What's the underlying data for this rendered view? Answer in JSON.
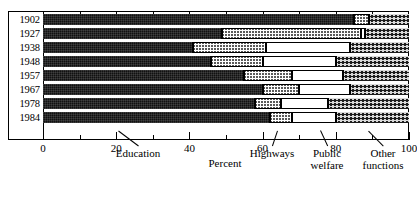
{
  "chart_data": {
    "type": "bar",
    "orientation": "horizontal",
    "stacked": true,
    "stacked_percent": true,
    "title": "",
    "subtitle": "",
    "xlabel": "Percent",
    "ylabel": "",
    "xlim": [
      0,
      100
    ],
    "xticks": [
      0,
      20,
      40,
      60,
      80,
      100
    ],
    "xtick_labels": [
      "0",
      "20",
      "40",
      "60",
      "80",
      "100"
    ],
    "xminor_ticks": [
      10,
      30,
      50,
      70,
      90
    ],
    "grid": false,
    "legend_position": "in-plot annotations with leader lines",
    "categories": [
      "1902",
      "1927",
      "1938",
      "1948",
      "1957",
      "1967",
      "1978",
      "1984"
    ],
    "series": [
      {
        "name": "Education",
        "fill": "solid-dark",
        "color": "#111111",
        "values": [
          85,
          49,
          41,
          46,
          55,
          60,
          58,
          62
        ]
      },
      {
        "name": "Highways",
        "fill": "dense-checker",
        "color": "#5a5a5a",
        "values": [
          4,
          38,
          20,
          14,
          13,
          10,
          7,
          6
        ]
      },
      {
        "name": "Public welfare",
        "fill": "sparse-dots",
        "color": "#2b2b2b",
        "values": [
          0,
          1,
          23,
          20,
          14,
          14,
          13,
          12
        ]
      },
      {
        "name": "Other functions",
        "fill": "dark-crosshatch",
        "color": "#1c1c1c",
        "values": [
          11,
          12,
          16,
          20,
          18,
          16,
          22,
          20
        ]
      }
    ],
    "annotations": [
      {
        "label": "Education",
        "lines": [
          "Education"
        ]
      },
      {
        "label": "Highways",
        "lines": [
          "Highways"
        ]
      },
      {
        "label": "Public welfare",
        "lines": [
          "Public",
          "welfare"
        ]
      },
      {
        "label": "Other functions",
        "lines": [
          "Other",
          "functions"
        ]
      }
    ]
  }
}
